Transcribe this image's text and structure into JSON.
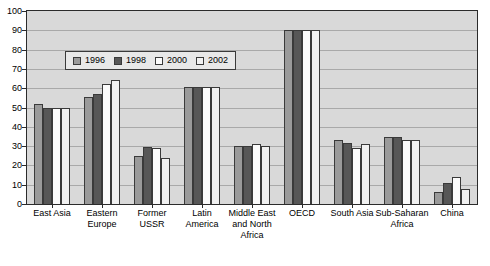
{
  "chart_data": {
    "type": "bar",
    "title": "",
    "xlabel": "",
    "ylabel": "",
    "ylim": [
      0,
      100
    ],
    "yticks": [
      0,
      10,
      20,
      30,
      40,
      50,
      60,
      70,
      80,
      90,
      100
    ],
    "grid": true,
    "legend_position": "upper-left-inside",
    "categories": [
      "East Asia",
      "Eastern Europe",
      "Former USSR",
      "Latin America",
      "Middle East and North Africa",
      "OECD",
      "South Asia",
      "Sub-Saharan Africa",
      "China"
    ],
    "series": [
      {
        "name": "1996",
        "color": "#9a9a9a",
        "values": [
          52,
          55.5,
          25,
          60.5,
          30,
          90,
          33,
          34.5,
          6
        ]
      },
      {
        "name": "1998",
        "color": "#575757",
        "values": [
          50,
          57,
          29.5,
          60.5,
          30,
          90,
          31.5,
          34.5,
          11
        ]
      },
      {
        "name": "2000",
        "color": "#fbfbfb",
        "values": [
          50,
          62,
          29,
          60.5,
          31,
          90,
          29,
          33,
          14
        ]
      },
      {
        "name": "2002",
        "color": "#f1f1f1",
        "values": [
          50,
          64.5,
          24,
          60.5,
          30,
          90,
          31,
          33,
          8
        ]
      }
    ]
  },
  "colors": {
    "plot_background": "#d9d9d9",
    "gridline": "#a9a9a9",
    "frame": "#2b2b2b",
    "legend_background": "#e8e8e8",
    "page_background": "#ffffff"
  }
}
